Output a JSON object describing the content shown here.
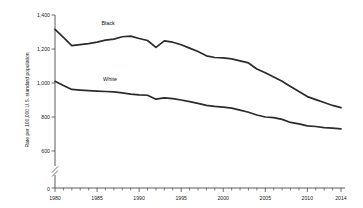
{
  "chart_data": {
    "type": "line",
    "title": "",
    "xlabel": "",
    "ylabel": "Rate per 100,000 U.S. standard population",
    "xlim": [
      1980,
      2014
    ],
    "ylim": [
      600,
      1400
    ],
    "y_axis_break": true,
    "y_break_value": 0,
    "grid": false,
    "legend": "inline-labels",
    "yticks": [
      "0",
      "600",
      "800",
      "1,000",
      "1,200",
      "1,400"
    ],
    "ytick_values": [
      0,
      600,
      800,
      1000,
      1200,
      1400
    ],
    "xticks": [
      "1980",
      "1985",
      "1990",
      "1995",
      "2000",
      "2005",
      "2010",
      "2014"
    ],
    "xtick_values": [
      1980,
      1985,
      1990,
      1995,
      2000,
      2005,
      2010,
      2014
    ],
    "x": [
      1980,
      1981,
      1982,
      1983,
      1984,
      1985,
      1986,
      1987,
      1988,
      1989,
      1990,
      1991,
      1992,
      1993,
      1994,
      1995,
      1996,
      1997,
      1998,
      1999,
      2000,
      2001,
      2002,
      2003,
      2004,
      2005,
      2006,
      2007,
      2008,
      2009,
      2010,
      2011,
      2012,
      2013,
      2014
    ],
    "series": [
      {
        "name": "Black",
        "label": "Black",
        "color": "#2b2b2b",
        "values": [
          1315,
          1268,
          1220,
          1226,
          1232,
          1240,
          1252,
          1258,
          1272,
          1276,
          1262,
          1250,
          1210,
          1248,
          1240,
          1225,
          1205,
          1185,
          1160,
          1150,
          1148,
          1142,
          1130,
          1118,
          1082,
          1060,
          1035,
          1010,
          980,
          950,
          920,
          902,
          885,
          868,
          855
        ]
      },
      {
        "name": "White",
        "label": "White",
        "color": "#2b2b2b",
        "values": [
          1010,
          985,
          962,
          958,
          955,
          952,
          950,
          948,
          942,
          935,
          930,
          928,
          905,
          912,
          908,
          900,
          890,
          880,
          868,
          862,
          858,
          852,
          840,
          828,
          812,
          800,
          796,
          786,
          768,
          760,
          748,
          744,
          738,
          734,
          730
        ]
      }
    ]
  },
  "labels": {
    "black_series_label": "Black",
    "white_series_label": "White"
  }
}
